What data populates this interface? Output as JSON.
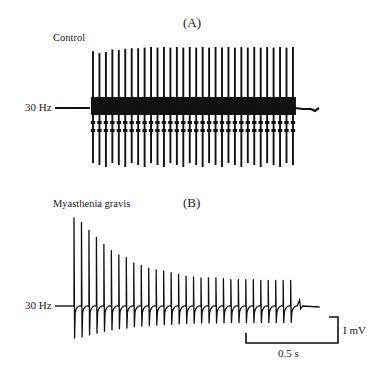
{
  "figure": {
    "panel_a": {
      "letter": "(A)",
      "condition": "Control",
      "stimulus_label": "30 Hz"
    },
    "panel_b": {
      "letter": "(B)",
      "condition": "Myasthenia gravis",
      "stimulus_label": "30 Hz"
    },
    "scale_bar": {
      "amplitude_label": "I mV",
      "time_label": "0.5 s"
    },
    "colors": {
      "trace": "#111111",
      "background": "#ffffff"
    }
  },
  "chart_data": [
    {
      "type": "line",
      "title": "(A) Control",
      "description": "Repetitive nerve stimulation at 30 Hz, compound muscle action potentials with constant amplitude",
      "stimulus_frequency_hz": 30,
      "spike_count": 32,
      "x_px_start": 93,
      "x_px_spacing": 6.45,
      "baseline_y_px": 108,
      "relative_amplitudes": [
        0.93,
        0.9,
        0.92,
        0.96,
        0.95,
        0.97,
        0.98,
        0.98,
        0.99,
        1.0,
        0.99,
        1.0,
        0.99,
        1.0,
        0.99,
        1.0,
        0.99,
        1.0,
        0.99,
        1.0,
        0.99,
        1.0,
        0.99,
        1.0,
        0.99,
        1.0,
        0.99,
        1.0,
        0.99,
        1.0,
        0.99,
        1.0
      ]
    },
    {
      "type": "line",
      "title": "(B) Myasthenia gravis",
      "description": "Repetitive nerve stimulation at 30 Hz showing decremental response in CMAP amplitude",
      "stimulus_frequency_hz": 30,
      "spike_count": 30,
      "x_px_start": 74,
      "x_px_spacing": 7.47,
      "baseline_y_px": 306,
      "relative_amplitudes": [
        1.0,
        0.95,
        0.86,
        0.78,
        0.7,
        0.63,
        0.58,
        0.55,
        0.49,
        0.46,
        0.43,
        0.41,
        0.4,
        0.38,
        0.36,
        0.34,
        0.33,
        0.32,
        0.32,
        0.32,
        0.31,
        0.3,
        0.3,
        0.3,
        0.3,
        0.29,
        0.29,
        0.29,
        0.29,
        0.29
      ]
    }
  ]
}
